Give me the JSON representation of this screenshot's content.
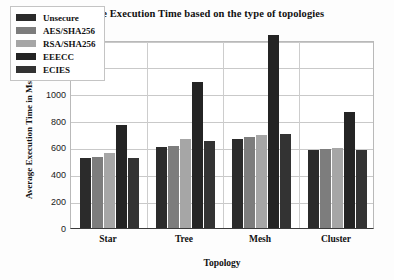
{
  "chart_data": {
    "type": "bar",
    "title": "Average Execution Time based on the type of topologies",
    "xlabel": "Topology",
    "ylabel": "Average Execution Time in Ms",
    "categories": [
      "Star",
      "Tree",
      "Mesh",
      "Cluster"
    ],
    "ylim": [
      0,
      1400
    ],
    "yticks": [
      0,
      200,
      400,
      600,
      800,
      1000,
      1200,
      1400
    ],
    "grid": true,
    "legend_position": "upper-left-inside",
    "series": [
      {
        "name": "Unsecure",
        "color": "#2b2b2b",
        "values": [
          520,
          600,
          665,
          580
        ]
      },
      {
        "name": "AES/SHA256",
        "color": "#7d7d7d",
        "values": [
          530,
          610,
          680,
          585
        ]
      },
      {
        "name": "RSA/SHA256",
        "color": "#a6a6a6",
        "values": [
          555,
          660,
          690,
          595
        ]
      },
      {
        "name": "EEECC",
        "color": "#242424",
        "values": [
          770,
          1090,
          1440,
          865
        ]
      },
      {
        "name": "ECIES",
        "color": "#333333",
        "values": [
          520,
          650,
          700,
          580
        ]
      }
    ]
  }
}
